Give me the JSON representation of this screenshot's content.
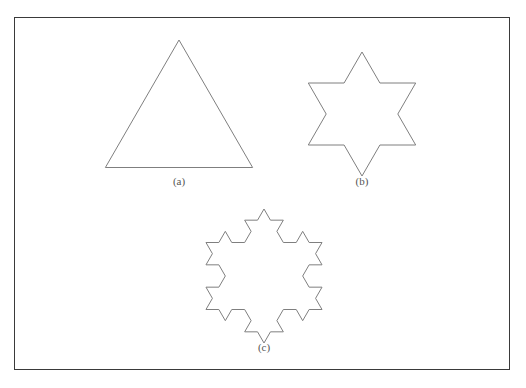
{
  "figure": {
    "background_color": "#ffffff",
    "border_color": "#3a3a3a",
    "stroke_color": "#7f7f7f",
    "stroke_width": 1,
    "panel": {
      "x": 14,
      "y": 17,
      "width": 496,
      "height": 353
    }
  },
  "panels": [
    {
      "id": "a",
      "caption": "(a)",
      "shape_name": "equilateral-triangle",
      "iteration": 0,
      "caption_x": 179,
      "caption_y": 175,
      "center": {
        "x": 179,
        "y": 125
      },
      "radius": 85,
      "rotation_deg": -90
    },
    {
      "id": "b",
      "caption": "(b)",
      "shape_name": "hexagram-star",
      "iteration": 1,
      "caption_x": 362,
      "caption_y": 175,
      "center": {
        "x": 362,
        "y": 114
      },
      "radius": 62,
      "rotation_deg": -90
    },
    {
      "id": "c",
      "caption": "(c)",
      "shape_name": "koch-snowflake",
      "iteration": 2,
      "caption_x": 264,
      "caption_y": 341,
      "center": {
        "x": 264,
        "y": 276
      },
      "radius": 67,
      "rotation_deg": -90
    }
  ],
  "chart_data": {
    "type": "diagram",
    "xlabel": "",
    "ylabel": "",
    "categories": [
      "(a)",
      "(b)",
      "(c)"
    ],
    "series": [
      {
        "name": "Koch iteration",
        "values": [
          0,
          1,
          2
        ]
      },
      {
        "name": "Number of edges",
        "values": [
          3,
          12,
          48
        ]
      },
      {
        "name": "Number of vertices",
        "values": [
          3,
          12,
          48
        ]
      }
    ],
    "legend_position": "none",
    "grid": false
  }
}
